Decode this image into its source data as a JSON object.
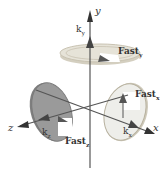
{
  "diagram": {
    "axes": {
      "x": {
        "label": "x"
      },
      "y": {
        "label": "y"
      },
      "z": {
        "label": "z"
      }
    },
    "labels": {
      "ky": {
        "base": "k",
        "sub": "y"
      },
      "kx": {
        "base": "k",
        "sub": "x"
      },
      "kz": {
        "base": "k",
        "sub": "z"
      },
      "fast_y": {
        "base": "Fast",
        "sub": "y"
      },
      "fast_x": {
        "base": "Fast",
        "sub": "x"
      },
      "fast_z": {
        "base": "Fast",
        "sub": "z"
      }
    },
    "colors": {
      "axis": "#555555",
      "disk_y_fill": "#e6e3d8",
      "disk_y_rim": "#c9c3b2",
      "disk_z_fill": "#9a9a9a",
      "disk_z_rim": "#7a7a7a",
      "disk_x_fill": "#eeeeea",
      "disk_x_rim": "#b8b2a0",
      "arrow": "#4a4a4a",
      "text": "#333333"
    }
  }
}
